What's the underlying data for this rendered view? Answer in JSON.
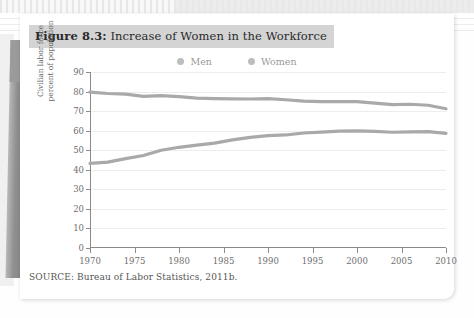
{
  "figure": {
    "number_label": "Figure 8.3:",
    "title_text": " Increase of Women in the Workforce",
    "source": "SOURCE: Bureau of Labor Statistics, 2011b."
  },
  "colors": {
    "men_line": "#a9a9a9",
    "women_line": "#a9a9a9",
    "legend_dot": "#bdbdbd",
    "grid": "#ededed",
    "axis": "#8a8a8a",
    "title_highlight": "#d4d4d4",
    "card_background": "#ffffff"
  },
  "chart_data": {
    "type": "line",
    "title": "Increase of Women in the Workforce",
    "xlabel": "",
    "ylabel": "Civilian labor force percent of population",
    "ylabel_line1": "Civilian labor force",
    "ylabel_line2": "percent of population",
    "xlim": [
      1970,
      2010
    ],
    "ylim": [
      0,
      90
    ],
    "ytick_values": [
      0,
      10,
      20,
      30,
      40,
      50,
      60,
      70,
      80,
      90
    ],
    "ytick_labels": [
      "0",
      "10",
      "20",
      "30",
      "40",
      "50",
      "60",
      "70",
      "80",
      "90"
    ],
    "xtick_values": [
      1970,
      1975,
      1980,
      1985,
      1990,
      1995,
      2000,
      2005,
      2010
    ],
    "xtick_labels": [
      "1970",
      "1975",
      "1980",
      "1985",
      "1990",
      "1995",
      "2000",
      "2005",
      "2010"
    ],
    "grid": "horizontal",
    "legend_position": "top-center",
    "x": [
      1970,
      1972,
      1974,
      1976,
      1978,
      1980,
      1982,
      1984,
      1986,
      1988,
      1990,
      1992,
      1994,
      1996,
      1998,
      2000,
      2002,
      2004,
      2006,
      2008,
      2010
    ],
    "series": [
      {
        "name": "Men",
        "values": [
          79.7,
          79.0,
          78.7,
          77.5,
          77.9,
          77.4,
          76.6,
          76.4,
          76.3,
          76.2,
          76.4,
          75.8,
          75.1,
          74.9,
          74.9,
          74.8,
          74.1,
          73.3,
          73.5,
          73.0,
          71.2
        ]
      },
      {
        "name": "Women",
        "values": [
          43.3,
          43.9,
          45.7,
          47.3,
          50.0,
          51.5,
          52.6,
          53.6,
          55.3,
          56.6,
          57.5,
          57.8,
          58.8,
          59.3,
          59.8,
          59.9,
          59.6,
          59.2,
          59.4,
          59.5,
          58.6
        ]
      }
    ],
    "legend": [
      "Men",
      "Women"
    ]
  }
}
